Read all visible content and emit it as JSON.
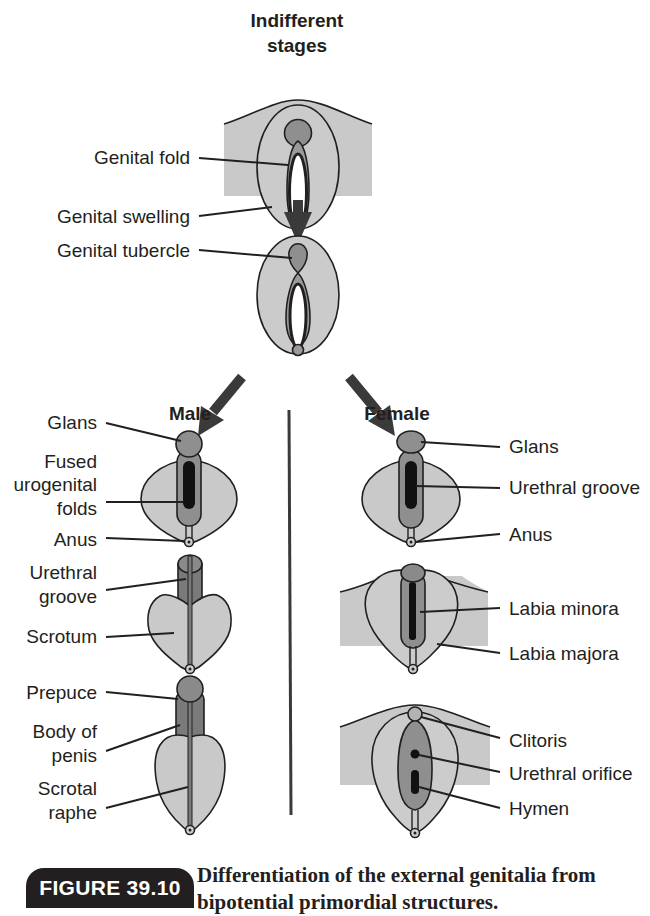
{
  "header": {
    "title_line1": "Indifferent",
    "title_line2": "stages"
  },
  "indifferent": {
    "stage1_labels": [
      "Genital fold",
      "Genital swelling"
    ],
    "stage2_labels": [
      "Genital tubercle"
    ]
  },
  "male": {
    "heading": "Male",
    "stage1_labels": [
      "Glans",
      "Fused",
      "urogenital",
      "folds",
      "Anus"
    ],
    "stage2_labels": [
      "Urethral",
      "groove",
      "Scrotum"
    ],
    "stage3_labels": [
      "Prepuce",
      "Body of",
      "penis",
      "Scrotal",
      "raphe"
    ]
  },
  "female": {
    "heading": "Female",
    "stage1_labels": [
      "Glans",
      "Urethral groove",
      "Anus"
    ],
    "stage2_labels": [
      "Labia minora",
      "Labia majora"
    ],
    "stage3_labels": [
      "Clitoris",
      "Urethral orifice",
      "Hymen"
    ]
  },
  "colors": {
    "light_gray": "#c9c9c9",
    "mid_gray": "#8f8f8f",
    "dark_gray": "#7a7a7a",
    "ink": "#231f20",
    "white": "#ffffff"
  },
  "caption": {
    "badge": "FIGURE 39.10",
    "text": "Differentiation of the external genitalia from bipotential primordial structures."
  }
}
